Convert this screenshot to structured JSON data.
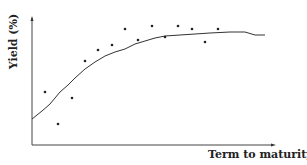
{
  "chart_data": {
    "type": "scatter",
    "title": "",
    "xlabel": "Term to maturity",
    "ylabel": "Yield (%)",
    "grid": false,
    "legend": null,
    "axes": {
      "x_ticks": [],
      "y_ticks": []
    },
    "series": [
      {
        "name": "Observed yields",
        "kind": "scatter",
        "points_px": [
          [
            45,
            92
          ],
          [
            58,
            124
          ],
          [
            72,
            98
          ],
          [
            85,
            61
          ],
          [
            98,
            50
          ],
          [
            112,
            45
          ],
          [
            125,
            29
          ],
          [
            138,
            40
          ],
          [
            152,
            26
          ],
          [
            165,
            37
          ],
          [
            178,
            26
          ],
          [
            192,
            29
          ],
          [
            205,
            42
          ],
          [
            218,
            29
          ]
        ]
      },
      {
        "name": "Fitted yield curve",
        "kind": "line",
        "points_px": [
          [
            32,
            119
          ],
          [
            42,
            111
          ],
          [
            50,
            104
          ],
          [
            60,
            92
          ],
          [
            68,
            85
          ],
          [
            75,
            78
          ],
          [
            85,
            69
          ],
          [
            95,
            62
          ],
          [
            105,
            56
          ],
          [
            115,
            52
          ],
          [
            125,
            49
          ],
          [
            135,
            44
          ],
          [
            145,
            41
          ],
          [
            155,
            38
          ],
          [
            165,
            36
          ],
          [
            180,
            35
          ],
          [
            195,
            34
          ],
          [
            210,
            33
          ],
          [
            230,
            32
          ],
          [
            245,
            32
          ],
          [
            255,
            35
          ],
          [
            265,
            35
          ]
        ]
      }
    ]
  }
}
